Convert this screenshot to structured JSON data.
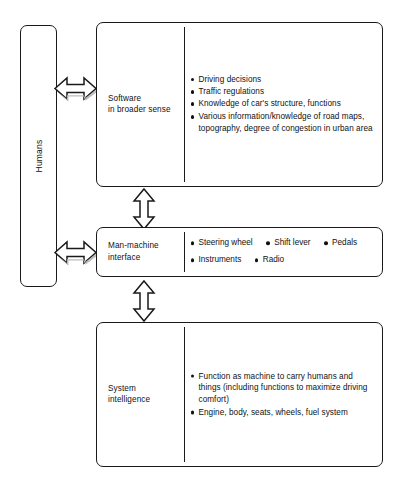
{
  "diagram": {
    "colors": {
      "stroke": "#1a1a1a",
      "fill": "#ffffff",
      "arrow_shadow": "#b8b8b8",
      "text": "#111111"
    },
    "humans": {
      "label": "Humans"
    },
    "panels": [
      {
        "id": "software",
        "title": "Software\nin broader sense",
        "title_lines": [
          "Software",
          "in broader sense"
        ],
        "bullets": [
          "Driving decisions",
          "Traffic regulations",
          "Knowledge of car's structure, functions",
          "Various information/knowledge of road maps, topography, degree of congestion in urban area"
        ]
      },
      {
        "id": "interface",
        "title": "Man-machine\ninterface",
        "title_lines": [
          "Man-machine",
          "interface"
        ],
        "bullet_rows": [
          [
            "Steering wheel",
            "Shift lever",
            "Pedals"
          ],
          [
            "Instruments",
            "Radio"
          ]
        ]
      },
      {
        "id": "system",
        "title": "System\nintelligence",
        "title_lines": [
          "System",
          "intelligence"
        ],
        "bullets": [
          "Function as machine to carry humans and things (including functions to maximize driving comfort)",
          "Engine, body, seats, wheels, fuel system"
        ]
      }
    ],
    "arrows": [
      {
        "id": "humans-software",
        "direction": "horizontal-bidirectional"
      },
      {
        "id": "humans-interface",
        "direction": "horizontal-bidirectional"
      },
      {
        "id": "software-interface",
        "direction": "vertical-bidirectional"
      },
      {
        "id": "interface-system",
        "direction": "vertical-bidirectional"
      }
    ]
  }
}
